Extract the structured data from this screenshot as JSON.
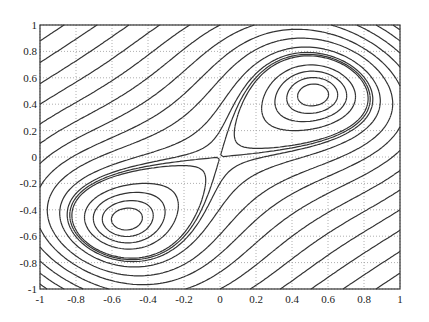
{
  "chart_data": {
    "type": "contour",
    "title": "",
    "xlabel": "",
    "ylabel": "",
    "xlim": [
      -1,
      1
    ],
    "ylim": [
      -1,
      1
    ],
    "grid": true,
    "grid_style": "dotted",
    "x_ticks": [
      "-1",
      "-0.8",
      "-0.6",
      "-0.4",
      "-0.2",
      "0",
      "0.2",
      "0.4",
      "0.6",
      "0.8",
      "1"
    ],
    "y_ticks": [
      "1",
      "0.8",
      "0.6",
      "0.4",
      "0.2",
      "0",
      "-0.2",
      "-0.4",
      "-0.6",
      "-0.8",
      "-1"
    ],
    "x_tick_values": [
      -1,
      -0.8,
      -0.6,
      -0.4,
      -0.2,
      0,
      0.2,
      0.4,
      0.6,
      0.8,
      1
    ],
    "y_tick_values": [
      1,
      0.8,
      0.6,
      0.4,
      0.2,
      0,
      -0.2,
      -0.4,
      -0.6,
      -0.8,
      -1
    ],
    "minima": [
      [
        0.47,
        0.52
      ],
      [
        -0.47,
        -0.52
      ]
    ],
    "saddle": [
      0,
      0
    ],
    "line_color": "#333333",
    "grid_color": "#999999"
  }
}
